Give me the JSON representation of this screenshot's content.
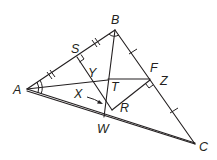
{
  "diagram": {
    "type": "geometry-triangle",
    "stroke_color": "#231f20",
    "background": "#ffffff",
    "points": {
      "A": {
        "label": "A",
        "x": 27,
        "y": 89
      },
      "B": {
        "label": "B",
        "x": 115,
        "y": 30
      },
      "C": {
        "label": "C",
        "x": 195,
        "y": 144
      },
      "S": {
        "label": "S",
        "x": 77,
        "y": 57
      },
      "Y": {
        "label": "Y",
        "x": 89,
        "y": 76
      },
      "T": {
        "label": "T",
        "x": 108,
        "y": 80
      },
      "F": {
        "label": "F",
        "x": 150,
        "y": 79
      },
      "Z": {
        "label": "Z",
        "x": 150,
        "y": 79
      },
      "X": {
        "label": "X",
        "x": 80,
        "y": 94
      },
      "R": {
        "label": "R",
        "x": 112,
        "y": 110
      },
      "W": {
        "label": "W",
        "x": 104,
        "y": 116
      }
    },
    "labels": {
      "A": "A",
      "B": "B",
      "C": "C",
      "S": "S",
      "Y": "Y",
      "T": "T",
      "F": "F",
      "Z": "Z",
      "X": "X",
      "R": "R",
      "W": "W"
    },
    "segments": [
      "AB",
      "BC",
      "AC",
      "AR",
      "AT",
      "BW",
      "SR",
      "TF",
      "RZ"
    ],
    "markings": {
      "AS_SB_double_ticks": true,
      "BF_FC_single_ticks": true,
      "right_angle_at_S": true,
      "right_angle_at_Z": true,
      "angle_arc_at_A_double": true,
      "angle_arc_at_B": true,
      "arrow_from_X_to_SR": true
    }
  }
}
